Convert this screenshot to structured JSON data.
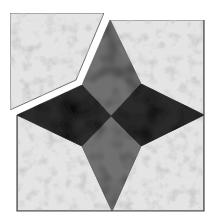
{
  "image": {
    "width": 216,
    "height": 222,
    "background": "#ffffff",
    "description": "Quilt block: four-pointed star with one corner background patch pulled away"
  },
  "colors": {
    "background_fabric": "#e4e4e4",
    "background_fabric_shade": "#c9c9c9",
    "star_points": "#707070",
    "star_points_shade": "#5e5e5e",
    "dark_diamonds": "#2b2b2b",
    "dark_diamonds_shade": "#1c1c1c",
    "outline": "#4a4a4a"
  },
  "block": {
    "outline": [
      [
        17,
        20
      ],
      [
        204,
        20
      ],
      [
        204,
        211
      ],
      [
        17,
        211
      ]
    ],
    "center": [
      111,
      116
    ]
  },
  "pieces": {
    "detached_patch": [
      [
        10,
        13
      ],
      [
        104,
        13
      ],
      [
        76,
        80
      ],
      [
        10,
        110
      ]
    ],
    "background_top_right": [
      [
        110,
        20
      ],
      [
        204,
        20
      ],
      [
        204,
        115
      ],
      [
        141,
        84
      ]
    ],
    "background_bottom_left": [
      [
        17,
        115
      ],
      [
        82,
        146
      ],
      [
        112,
        211
      ],
      [
        17,
        211
      ]
    ],
    "background_bottom_right": [
      [
        204,
        115
      ],
      [
        204,
        211
      ],
      [
        112,
        211
      ],
      [
        141,
        146
      ]
    ],
    "background_top_left_gap": [
      [
        17,
        20
      ],
      [
        110,
        20
      ],
      [
        82,
        85
      ],
      [
        17,
        115
      ]
    ],
    "star_top": [
      [
        110,
        20
      ],
      [
        141,
        84
      ],
      [
        111,
        116
      ],
      [
        82,
        85
      ]
    ],
    "star_bottom": [
      [
        111,
        116
      ],
      [
        141,
        146
      ],
      [
        112,
        211
      ],
      [
        82,
        146
      ]
    ],
    "dark_left": [
      [
        17,
        115
      ],
      [
        82,
        85
      ],
      [
        111,
        116
      ],
      [
        82,
        146
      ]
    ],
    "dark_right": [
      [
        204,
        115
      ],
      [
        141,
        146
      ],
      [
        111,
        116
      ],
      [
        141,
        84
      ]
    ]
  }
}
